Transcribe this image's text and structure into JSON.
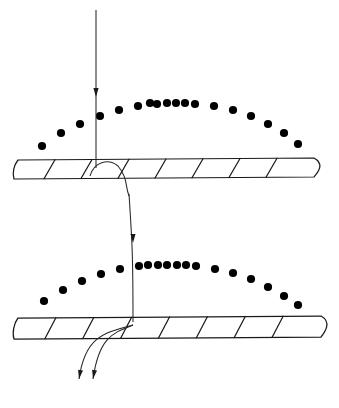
{
  "figure": {
    "type": "diagram",
    "width": 339,
    "height": 408,
    "background_color": "#ffffff",
    "ink_color": "#1a1a1a",
    "dot_color": "#000000"
  },
  "upper_arc": {
    "name": "upper-dotted-arc",
    "dot_radius": 4.1,
    "dot_count": 18,
    "dots": [
      {
        "x": 42,
        "y": 146
      },
      {
        "x": 61,
        "y": 133
      },
      {
        "x": 80,
        "y": 124
      },
      {
        "x": 100,
        "y": 116
      },
      {
        "x": 119,
        "y": 110
      },
      {
        "x": 138,
        "y": 106
      },
      {
        "x": 157,
        "y": 104
      },
      {
        "x": 176,
        "y": 103
      },
      {
        "x": 195,
        "y": 104
      },
      {
        "x": 214,
        "y": 106
      },
      {
        "x": 233,
        "y": 110
      },
      {
        "x": 251,
        "y": 116
      },
      {
        "x": 268,
        "y": 124
      },
      {
        "x": 284,
        "y": 133
      },
      {
        "x": 298,
        "y": 144
      },
      {
        "x": 150,
        "y": 103
      },
      {
        "x": 167,
        "y": 103
      },
      {
        "x": 185,
        "y": 103
      }
    ]
  },
  "lower_arc": {
    "name": "lower-dotted-arc",
    "dot_radius": 4.1,
    "dot_count": 18,
    "dots": [
      {
        "x": 44,
        "y": 301
      },
      {
        "x": 63,
        "y": 290
      },
      {
        "x": 82,
        "y": 281
      },
      {
        "x": 101,
        "y": 274
      },
      {
        "x": 120,
        "y": 269
      },
      {
        "x": 139,
        "y": 266
      },
      {
        "x": 158,
        "y": 265
      },
      {
        "x": 177,
        "y": 265
      },
      {
        "x": 196,
        "y": 266
      },
      {
        "x": 215,
        "y": 269
      },
      {
        "x": 233,
        "y": 273
      },
      {
        "x": 251,
        "y": 279
      },
      {
        "x": 268,
        "y": 287
      },
      {
        "x": 284,
        "y": 296
      },
      {
        "x": 298,
        "y": 305
      },
      {
        "x": 148,
        "y": 265
      },
      {
        "x": 167,
        "y": 265
      },
      {
        "x": 186,
        "y": 265
      }
    ]
  },
  "upper_band": {
    "name": "upper-hatched-band",
    "top_left": {
      "x": 18,
      "y": 160
    },
    "top_right": {
      "x": 314,
      "y": 158
    },
    "bottom_right": {
      "x": 305,
      "y": 177
    },
    "bottom_left": {
      "x": 14,
      "y": 179
    },
    "rib_count": 7,
    "rib_slant": 11
  },
  "lower_band": {
    "name": "lower-hatched-band",
    "top_left": {
      "x": 18,
      "y": 318
    },
    "top_right": {
      "x": 321,
      "y": 316
    },
    "bottom_right": {
      "x": 312,
      "y": 337
    },
    "bottom_left": {
      "x": 14,
      "y": 339
    },
    "rib_count": 7,
    "rib_slant": 11
  },
  "incoming_ray": {
    "name": "incoming-vertical-ray",
    "start": {
      "x": 96,
      "y": 10
    },
    "end": {
      "x": 96,
      "y": 168
    },
    "arrow_at": {
      "x": 96,
      "y": 97
    },
    "direction": "down"
  },
  "transfer_ray": {
    "name": "inter-band-transfer-ray",
    "description": "Curved path leaving the underside of the upper band and descending to the lower band",
    "hook_start": {
      "x": 96,
      "y": 178
    },
    "hook_peak": {
      "x": 112,
      "y": 160
    },
    "descend_to": {
      "x": 133,
      "y": 322
    },
    "arrow_at": {
      "x": 133,
      "y": 243
    },
    "direction": "down"
  },
  "outgoing_rays": [
    {
      "name": "outgoing-ray-left",
      "start": {
        "x": 133,
        "y": 325
      },
      "end": {
        "x": 79,
        "y": 379
      },
      "arrow_at": {
        "x": 79,
        "y": 379
      },
      "direction": "down-left"
    },
    {
      "name": "outgoing-ray-right",
      "start": {
        "x": 133,
        "y": 325
      },
      "end": {
        "x": 93,
        "y": 379
      },
      "arrow_at": {
        "x": 93,
        "y": 379
      },
      "direction": "down-left"
    }
  ],
  "labels": {
    "visible_text": []
  }
}
